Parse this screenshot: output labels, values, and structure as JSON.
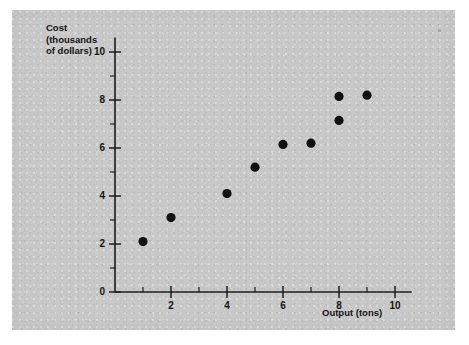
{
  "figure": {
    "panel_color": "#c8c8c8",
    "background_color": "#ffffff",
    "point_color": "#111111",
    "axis_color": "#1d1d1d",
    "ylabel_text": "Cost\n(thousands\nof dollars)",
    "xlabel_text": "Output (tons)"
  },
  "chart_data": {
    "type": "scatter",
    "title": "",
    "xlabel": "Output (tons)",
    "ylabel": "Cost (thousands of dollars)",
    "xlim": [
      0,
      10.6
    ],
    "ylim": [
      0,
      10.6
    ],
    "grid": false,
    "legend": null,
    "x_major_ticks": [
      2,
      4,
      6,
      8,
      10
    ],
    "x_minor_ticks": [
      1,
      3,
      5,
      7,
      9
    ],
    "y_major_ticks": [
      0,
      2,
      4,
      6,
      8,
      10
    ],
    "y_minor_ticks": [
      1,
      3,
      5,
      7,
      9
    ],
    "x_tick_labels": [
      "2",
      "4",
      "6",
      "8",
      "10"
    ],
    "y_tick_labels": [
      "0",
      "2",
      "4",
      "6",
      "8",
      "10"
    ],
    "points": [
      {
        "x": 1,
        "y": 2.1
      },
      {
        "x": 2,
        "y": 3.1
      },
      {
        "x": 4,
        "y": 4.1
      },
      {
        "x": 5,
        "y": 5.2
      },
      {
        "x": 6,
        "y": 6.15
      },
      {
        "x": 7,
        "y": 6.2
      },
      {
        "x": 8,
        "y": 7.15
      },
      {
        "x": 8,
        "y": 8.15
      },
      {
        "x": 9,
        "y": 8.2
      }
    ]
  }
}
